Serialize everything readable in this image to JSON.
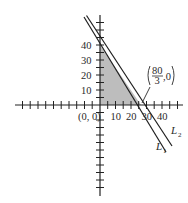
{
  "figure": {
    "type": "linear-programming-feasible-region",
    "origin_label": "(0, 0)",
    "x_tick_labels": [
      "10",
      "20",
      "30",
      "40"
    ],
    "y_tick_labels": [
      "10",
      "20",
      "30",
      "40"
    ],
    "intercept_annotation": {
      "numerator": "80",
      "denominator": "3",
      "suffix": ",0",
      "point": [
        26.667,
        0
      ]
    },
    "lines": [
      {
        "name": "L1",
        "label_main": "L",
        "label_sub": "1",
        "x_intercept": 26.667,
        "y_intercept": 40
      },
      {
        "name": "L2",
        "label_main": "L",
        "label_sub": "2",
        "x_intercept": 28.5,
        "y_intercept": 41
      }
    ],
    "shaded_region": {
      "vertices": [
        [
          0,
          0
        ],
        [
          0,
          40
        ],
        [
          26.667,
          0
        ]
      ],
      "color": "#bdbdbd"
    },
    "colors": {
      "axis": "#222222",
      "line": "#1e1e1e",
      "shade": "#bdbdbd"
    }
  }
}
